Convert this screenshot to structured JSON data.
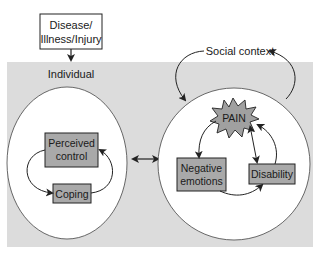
{
  "colors": {
    "background": "#ffffff",
    "panel": "#dcdcdc",
    "ellipse": "#ffffff",
    "box_fill": "#a9a9a9",
    "pain_fill": "#a0a0a0",
    "line": "#222222"
  },
  "top_box": {
    "line1": "Disease/",
    "line2": "Illness/Injury"
  },
  "individual": {
    "label": "Individual",
    "perceived_control": {
      "line1": "Perceived",
      "line2": "control"
    },
    "coping": "Coping"
  },
  "social": {
    "label": "Social context",
    "pain": "PAIN",
    "negative_emotions": {
      "line1": "Negative",
      "line2": "emotions"
    },
    "disability": "Disability"
  }
}
